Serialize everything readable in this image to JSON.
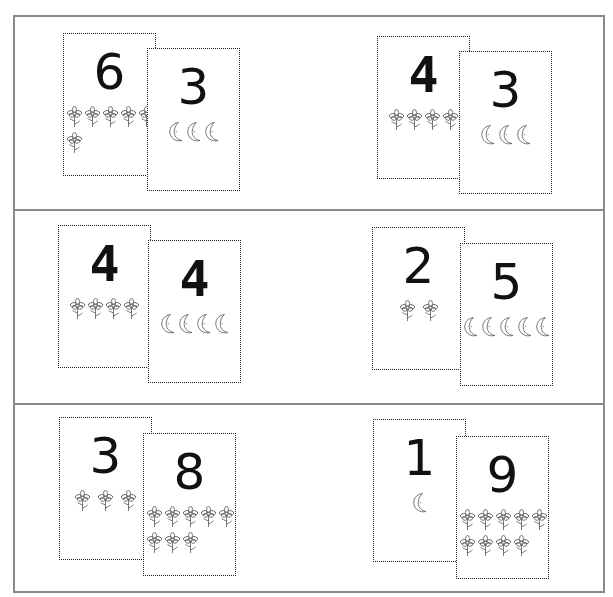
{
  "worksheet": {
    "frame_color": "#8a8a8a",
    "card_border_color": "#1a1a1a",
    "numeral_color": "#111111",
    "icon_stroke_color": "#555555",
    "rows": [
      {
        "pairs": [
          {
            "cards": [
              {
                "numeral": "6",
                "icon": "flower-icon",
                "count": 6,
                "rows": [
                  5,
                  1
                ],
                "x": 63,
                "y": 33
              },
              {
                "numeral": "3",
                "icon": "moon-icon",
                "count": 3,
                "rows": [
                  3
                ],
                "x": 147,
                "y": 48
              }
            ]
          },
          {
            "cards": [
              {
                "numeral": "4",
                "icon": "flower-icon",
                "count": 4,
                "rows": [
                  4
                ],
                "x": 377,
                "y": 36
              },
              {
                "numeral": "3",
                "icon": "moon-icon",
                "count": 3,
                "rows": [
                  3
                ],
                "x": 459,
                "y": 51
              }
            ]
          }
        ]
      },
      {
        "pairs": [
          {
            "cards": [
              {
                "numeral": "4",
                "icon": "flower-icon",
                "count": 4,
                "rows": [
                  4
                ],
                "x": 58,
                "y": 225
              },
              {
                "numeral": "4",
                "icon": "moon-icon",
                "count": 4,
                "rows": [
                  4
                ],
                "x": 148,
                "y": 240
              }
            ]
          },
          {
            "cards": [
              {
                "numeral": "2",
                "icon": "flower-icon",
                "count": 2,
                "rows": [
                  2
                ],
                "x": 372,
                "y": 227
              },
              {
                "numeral": "5",
                "icon": "moon-icon",
                "count": 5,
                "rows": [
                  5
                ],
                "x": 460,
                "y": 243
              }
            ]
          }
        ]
      },
      {
        "pairs": [
          {
            "cards": [
              {
                "numeral": "3",
                "icon": "flower-icon",
                "count": 3,
                "rows": [
                  3
                ],
                "x": 59,
                "y": 417
              },
              {
                "numeral": "8",
                "icon": "flower-icon",
                "count": 8,
                "rows": [
                  5,
                  3
                ],
                "x": 143,
                "y": 433
              }
            ]
          },
          {
            "cards": [
              {
                "numeral": "1",
                "icon": "moon-icon",
                "count": 1,
                "rows": [
                  1
                ],
                "x": 373,
                "y": 419
              },
              {
                "numeral": "9",
                "icon": "flower-icon",
                "count": 9,
                "rows": [
                  5,
                  4
                ],
                "x": 456,
                "y": 436
              }
            ]
          }
        ]
      }
    ],
    "dividers_y": [
      209,
      403
    ]
  }
}
